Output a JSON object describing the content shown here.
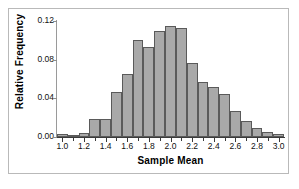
{
  "chart_data": {
    "type": "bar",
    "title": "",
    "xlabel": "Sample Mean",
    "ylabel": "Relative Frequency",
    "xlim": [
      0.95,
      3.05
    ],
    "ylim": [
      0.0,
      0.12
    ],
    "grid": false,
    "legend": null,
    "bin_width": 0.1,
    "bar_color": "#a9a9a9",
    "bar_edge_color": "#5a5a5a",
    "xticks": [
      "1.0",
      "1.2",
      "1.4",
      "1.6",
      "1.8",
      "2.0",
      "2.2",
      "2.4",
      "2.6",
      "2.8",
      "3.0"
    ],
    "xtick_values": [
      1.0,
      1.2,
      1.4,
      1.6,
      1.8,
      2.0,
      2.2,
      2.4,
      2.6,
      2.8,
      3.0
    ],
    "yticks": [
      "0.00",
      "0.04",
      "0.08",
      "0.12"
    ],
    "ytick_values": [
      0.0,
      0.04,
      0.08,
      0.12
    ],
    "minor_xtick_values": [
      1.0,
      1.1,
      1.2,
      1.3,
      1.4,
      1.5,
      1.6,
      1.7,
      1.8,
      1.9,
      2.0,
      2.1,
      2.2,
      2.3,
      2.4,
      2.5,
      2.6,
      2.7,
      2.8,
      2.9,
      3.0
    ],
    "categories": [
      "0.95-1.05",
      "1.05-1.15",
      "1.15-1.25",
      "1.25-1.35",
      "1.35-1.45",
      "1.45-1.55",
      "1.55-1.65",
      "1.65-1.75",
      "1.75-1.85",
      "1.85-1.95",
      "1.95-2.05",
      "2.05-2.15",
      "2.15-2.25",
      "2.25-2.35",
      "2.35-2.45",
      "2.45-2.55",
      "2.55-2.65",
      "2.65-2.75",
      "2.75-2.85",
      "2.85-2.95",
      "2.95-3.05"
    ],
    "bin_centers": [
      1.0,
      1.1,
      1.2,
      1.3,
      1.4,
      1.5,
      1.6,
      1.7,
      1.8,
      1.9,
      2.0,
      2.1,
      2.2,
      2.3,
      2.4,
      2.5,
      2.6,
      2.7,
      2.8,
      2.9,
      3.0
    ],
    "values": [
      0.003,
      0.002,
      0.004,
      0.019,
      0.019,
      0.047,
      0.065,
      0.1,
      0.093,
      0.11,
      0.115,
      0.113,
      0.077,
      0.057,
      0.052,
      0.045,
      0.027,
      0.017,
      0.009,
      0.005,
      0.003
    ]
  }
}
